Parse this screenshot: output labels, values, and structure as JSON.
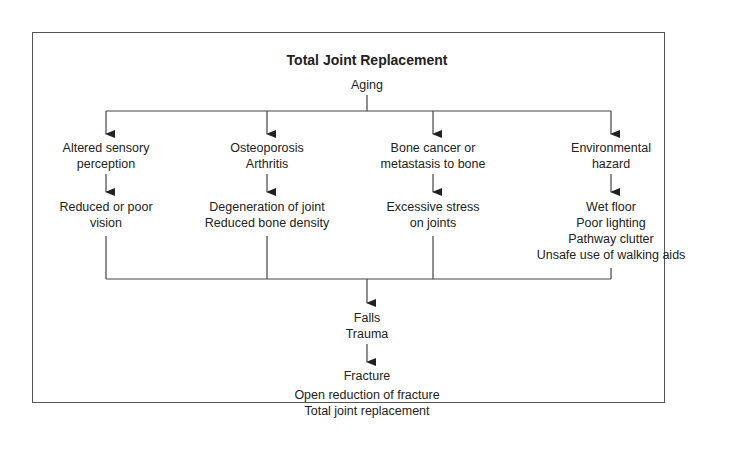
{
  "title": "Total Joint Replacement",
  "root": "Aging",
  "columns": [
    {
      "cause": [
        "Altered sensory",
        "perception"
      ],
      "effect": [
        "Reduced or poor",
        "vision"
      ]
    },
    {
      "cause": [
        "Osteoporosis",
        "Arthritis"
      ],
      "effect": [
        "Degeneration of joint",
        "Reduced bone density"
      ]
    },
    {
      "cause": [
        "Bone cancer or",
        "metastasis to bone"
      ],
      "effect": [
        "Excessive stress",
        "on joints"
      ]
    },
    {
      "cause": [
        "Environmental",
        "hazard"
      ],
      "effect": [
        "Wet floor",
        "Poor lighting",
        "Pathway clutter",
        "Unsafe use of walking aids"
      ]
    }
  ],
  "falls": [
    "Falls",
    "Trauma"
  ],
  "fracture": "Fracture",
  "outcome": [
    "Open reduction of fracture",
    "Total joint replacement"
  ]
}
